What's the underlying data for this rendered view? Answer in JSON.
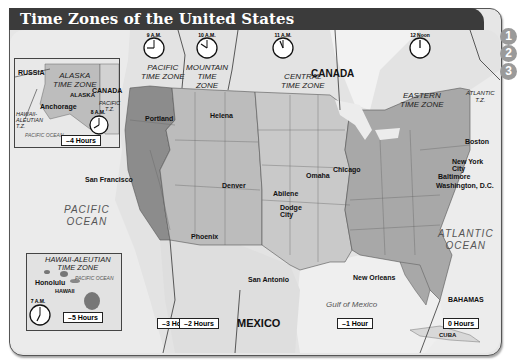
{
  "title": "Time Zones of the United States",
  "side_numbers": [
    "1",
    "2",
    "3"
  ],
  "zones": [
    {
      "name": "PACIFIC\nTIME ZONE",
      "clock": "9 A.M.",
      "hours_offset": "–3 Hours"
    },
    {
      "name": "MOUNTAIN\nTIME\nZONE",
      "clock": "10 A.M.",
      "hours_offset": "–2 Hours"
    },
    {
      "name": "CENTRAL\nTIME ZONE",
      "clock": "11 A.M.",
      "hours_offset": "–1 Hour"
    },
    {
      "name": "EASTERN\nTIME ZONE",
      "clock": "12 Noon",
      "hours_offset": "0 Hours"
    },
    {
      "name": "ATLANTIC\nT.Z."
    }
  ],
  "alaska_inset": {
    "zone_label": "ALASKA\nTIME ZONE",
    "state": "ALASKA",
    "city": "Anchorage",
    "russia": "RUSSIA",
    "canada": "CANADA",
    "pacific_tz": "PACIFIC\nT.Z.",
    "hawaii_aleutian_tz": "HAWAII-\nALEUTIAN\nT.Z.",
    "ocean": "PACIFIC OCEAN",
    "clock": "8 A.M.",
    "hours_offset": "–4 Hours"
  },
  "hawaii_inset": {
    "zone_label": "HAWAII-ALEUTIAN\nTIME ZONE",
    "ocean": "PACIFIC OCEAN",
    "city": "Honolulu",
    "state": "HAWAII",
    "clock": "7 A.M.",
    "hours_offset": "–5 Hours"
  },
  "countries": {
    "canada": "CANADA",
    "mexico": "MEXICO",
    "bahamas": "BAHAMAS",
    "cuba": "CUBA"
  },
  "oceans": {
    "pacific": "PACIFIC\nOCEAN",
    "atlantic": "ATLANTIC\nOCEAN",
    "gulf": "Gulf of Mexico"
  },
  "cities": [
    {
      "name": "Portland"
    },
    {
      "name": "Helena"
    },
    {
      "name": "San Francisco"
    },
    {
      "name": "Denver"
    },
    {
      "name": "Abilene"
    },
    {
      "name": "Omaha"
    },
    {
      "name": "Dodge\nCity"
    },
    {
      "name": "Chicago"
    },
    {
      "name": "Boston"
    },
    {
      "name": "New York\nCity"
    },
    {
      "name": "Baltimore"
    },
    {
      "name": "Washington, D.C."
    },
    {
      "name": "Phoenix"
    },
    {
      "name": "San Antonio"
    },
    {
      "name": "New Orleans"
    }
  ],
  "colors": {
    "title_bar": "#3a3a3a",
    "pacific": "#8a8a8a",
    "mountain": "#b9b9b9",
    "central": "#c8c8c8",
    "eastern": "#a6a6a6",
    "water": "#eeeeee",
    "land": "#dcdcdc"
  }
}
